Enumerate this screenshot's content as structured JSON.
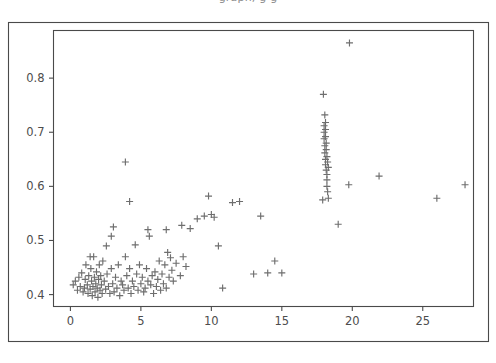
{
  "figure": {
    "background_color": "#ffffff",
    "frame_color": "#4a4a4a",
    "marker_color": "#6e6e6e",
    "tick_label_color": "#4d4d4d",
    "top_clipped_text": "graph,                          g     g"
  },
  "axes": {
    "x_ticks": [
      "0",
      "5",
      "10",
      "15",
      "20",
      "25"
    ],
    "y_ticks": [
      "0.4",
      "0.5",
      "0.6",
      "0.7",
      "0.8"
    ],
    "x_label": "",
    "y_label": "",
    "title": ""
  },
  "chart_data": {
    "type": "scatter",
    "title": "",
    "xlabel": "",
    "ylabel": "",
    "xlim": [
      -1.2,
      28.6
    ],
    "ylim": [
      0.378,
      0.888
    ],
    "grid": false,
    "legend": null,
    "marker": "+",
    "marker_color": "#6e6e6e",
    "marker_size": 7,
    "xticks": [
      0,
      5,
      10,
      15,
      20,
      25
    ],
    "yticks": [
      0.4,
      0.5,
      0.6,
      0.7,
      0.8
    ],
    "series": [
      {
        "name": "points",
        "x": [
          0.2,
          0.35,
          0.5,
          0.6,
          0.7,
          0.8,
          0.9,
          1.0,
          1.05,
          1.1,
          1.2,
          1.25,
          1.3,
          1.4,
          1.45,
          1.5,
          1.55,
          1.6,
          1.65,
          1.7,
          1.75,
          1.8,
          1.85,
          1.9,
          1.95,
          2.0,
          2.05,
          2.1,
          2.15,
          2.2,
          2.25,
          2.3,
          2.4,
          2.5,
          2.55,
          2.6,
          2.7,
          2.8,
          2.9,
          3.0,
          3.05,
          3.1,
          3.2,
          3.3,
          3.4,
          3.5,
          3.6,
          3.7,
          3.8,
          3.9,
          4.0,
          4.1,
          4.2,
          4.3,
          4.4,
          4.5,
          4.6,
          4.7,
          4.8,
          4.9,
          5.0,
          5.1,
          5.2,
          5.3,
          5.4,
          5.5,
          5.6,
          5.7,
          5.8,
          5.9,
          6.0,
          6.1,
          6.2,
          6.3,
          6.4,
          6.5,
          6.6,
          6.7,
          6.8,
          6.9,
          7.0,
          7.1,
          7.2,
          7.3,
          7.5,
          7.8,
          8.0,
          8.2,
          8.5,
          9.0,
          9.5,
          9.8,
          10.0,
          10.2,
          10.5,
          10.8,
          11.5,
          12.0,
          13.0,
          13.5,
          14.0,
          14.5,
          15.0,
          17.9,
          17.95,
          18.0,
          18.0,
          18.0,
          18.05,
          18.05,
          18.05,
          18.1,
          18.1,
          18.1,
          18.1,
          18.1,
          18.15,
          18.15,
          18.15,
          18.2,
          18.2,
          18.2,
          18.2,
          18.25,
          18.25,
          18.3,
          18.3,
          19.0,
          19.8,
          19.75,
          21.9,
          26.0,
          28.0,
          3.9,
          4.2,
          1.4,
          2.9,
          5.5,
          6.8,
          7.9
        ],
        "y": [
          0.418,
          0.425,
          0.408,
          0.432,
          0.415,
          0.44,
          0.405,
          0.412,
          0.428,
          0.455,
          0.418,
          0.402,
          0.435,
          0.41,
          0.448,
          0.425,
          0.398,
          0.415,
          0.47,
          0.432,
          0.405,
          0.42,
          0.442,
          0.412,
          0.395,
          0.428,
          0.455,
          0.408,
          0.435,
          0.418,
          0.402,
          0.462,
          0.425,
          0.41,
          0.49,
          0.438,
          0.415,
          0.402,
          0.448,
          0.42,
          0.525,
          0.405,
          0.432,
          0.412,
          0.455,
          0.398,
          0.425,
          0.418,
          0.408,
          0.47,
          0.435,
          0.412,
          0.448,
          0.402,
          0.425,
          0.415,
          0.492,
          0.438,
          0.408,
          0.455,
          0.42,
          0.432,
          0.405,
          0.412,
          0.448,
          0.425,
          0.508,
          0.418,
          0.435,
          0.402,
          0.442,
          0.415,
          0.428,
          0.462,
          0.408,
          0.438,
          0.42,
          0.455,
          0.412,
          0.478,
          0.432,
          0.468,
          0.445,
          0.425,
          0.458,
          0.435,
          0.47,
          0.452,
          0.522,
          0.54,
          0.545,
          0.582,
          0.548,
          0.543,
          0.49,
          0.412,
          0.57,
          0.572,
          0.438,
          0.545,
          0.44,
          0.462,
          0.44,
          0.575,
          0.77,
          0.712,
          0.7,
          0.688,
          0.732,
          0.675,
          0.662,
          0.718,
          0.705,
          0.692,
          0.65,
          0.64,
          0.68,
          0.668,
          0.63,
          0.655,
          0.622,
          0.612,
          0.6,
          0.645,
          0.59,
          0.635,
          0.578,
          0.53,
          0.865,
          0.603,
          0.619,
          0.578,
          0.603,
          0.645,
          0.572,
          0.47,
          0.508,
          0.52,
          0.52,
          0.528
        ]
      }
    ]
  }
}
